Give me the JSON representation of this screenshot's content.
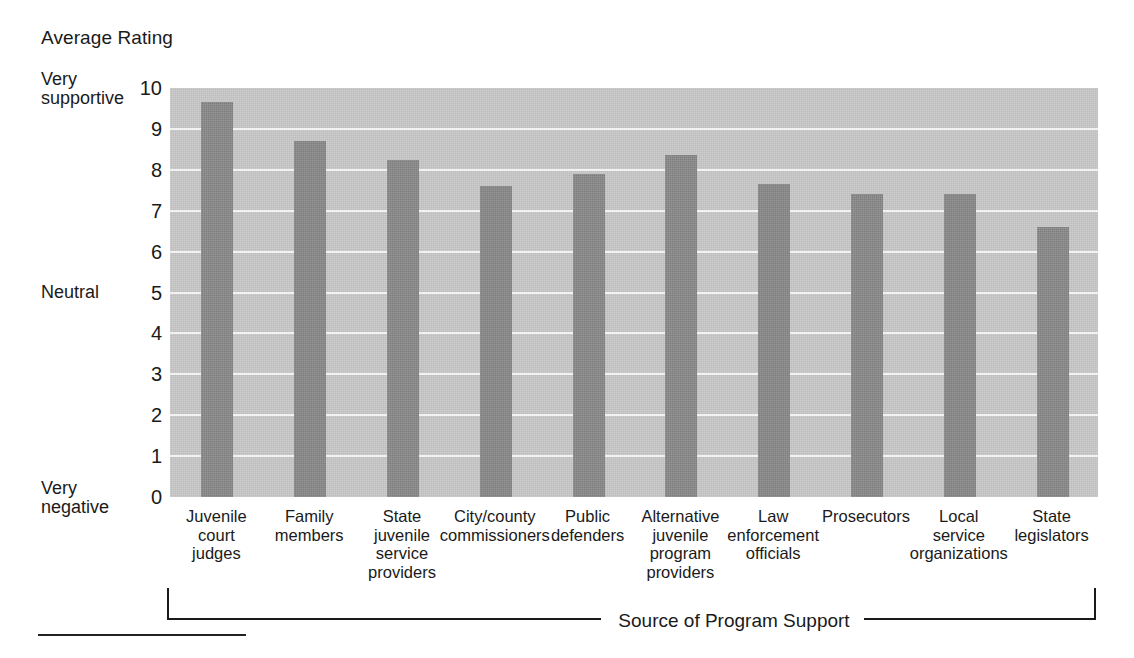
{
  "chart_data": {
    "type": "bar",
    "title": "Average Rating",
    "xlabel": "Source of Program Support",
    "ylabel": "Average Rating",
    "ylim": [
      0,
      10
    ],
    "yticks": [
      0,
      1,
      2,
      3,
      4,
      5,
      6,
      7,
      8,
      9,
      10
    ],
    "grid": true,
    "legend": null,
    "y_anchor_labels": [
      {
        "value": 10,
        "label": "Very\nsupportive"
      },
      {
        "value": 5,
        "label": "Neutral"
      },
      {
        "value": 0,
        "label": "Very\nnegative"
      }
    ],
    "categories": [
      "Juvenile\ncourt\njudges",
      "Family\nmembers",
      "State\njuvenile\nservice\nproviders",
      "City/county\ncommissioners",
      "Public\ndefenders",
      "Alternative\njuvenile\nprogram\nproviders",
      "Law\nenforcement\nofficials",
      "Prosecutors",
      "Local\nservice\norganizations",
      "State\nlegislators"
    ],
    "values": [
      9.65,
      8.7,
      8.25,
      7.6,
      7.9,
      8.35,
      7.65,
      7.4,
      7.4,
      6.6
    ]
  },
  "colors": {
    "plot_background": "#c9c9c9",
    "bar_fill": "#8b8b8b",
    "gridline": "#f2f2f2",
    "text": "#1a1a1a",
    "page_background": "#ffffff"
  }
}
